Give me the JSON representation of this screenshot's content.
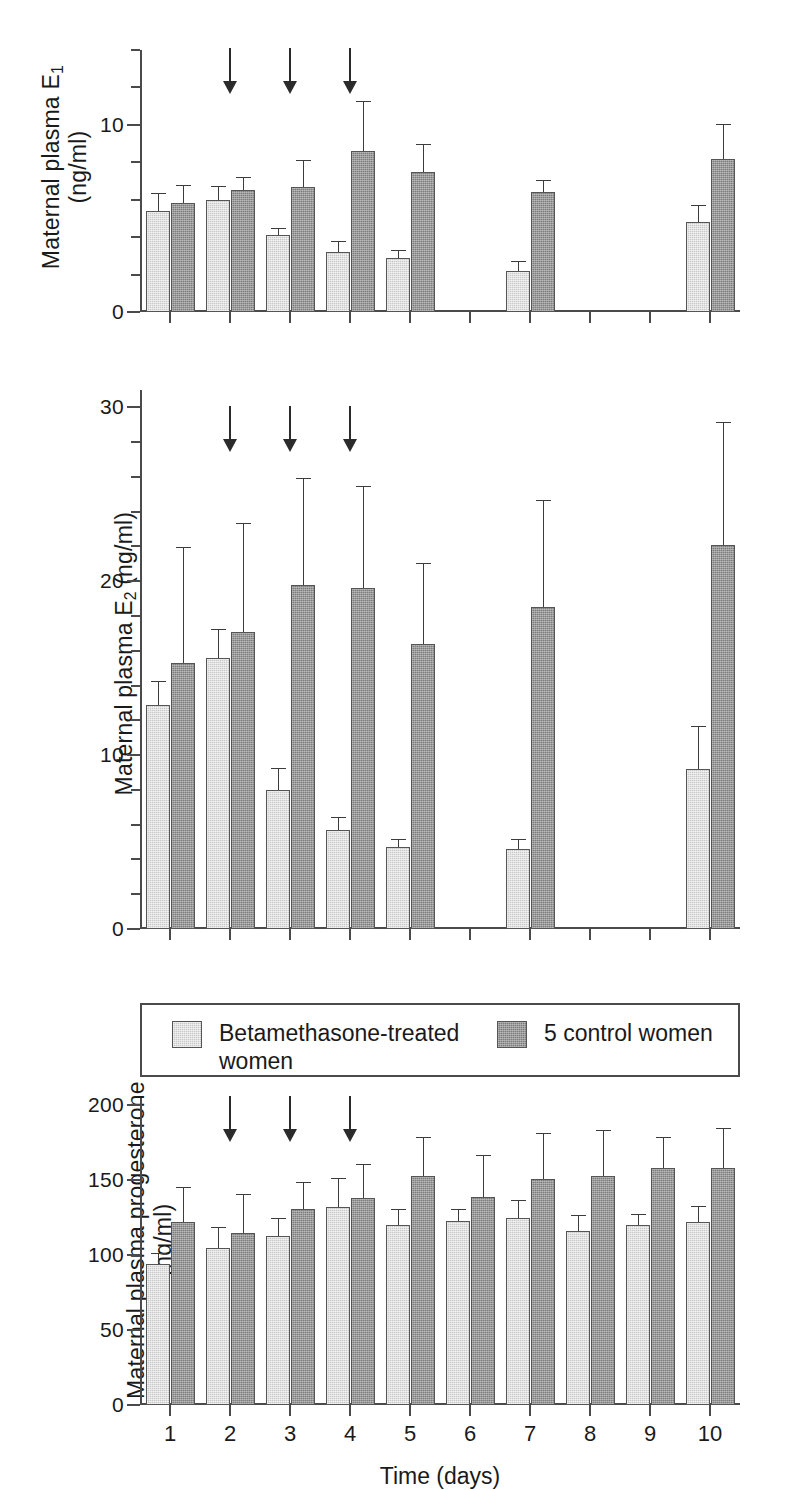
{
  "figure": {
    "xlabel": "Time (days)",
    "categories": [
      "1",
      "2",
      "3",
      "4",
      "5",
      "6",
      "7",
      "8",
      "9",
      "10"
    ],
    "treatment_arrow_days": [
      2,
      3,
      4
    ],
    "colors": {
      "treated_bar": "#c9c9c9",
      "control_bar": "#7d7d7d",
      "axis": "#4a4a4a",
      "text": "#1a1a1a",
      "error_bar": "#3c3c3c"
    }
  },
  "legend": {
    "treated_label": "Betamethasone-treated women",
    "control_label": "5 control women"
  },
  "chart_data": [
    {
      "type": "bar",
      "id": "panel-e1",
      "title": "",
      "ylabel": "Maternal plasma E₁ (ng/ml)",
      "ylabel_line1": "Maternal plasma E",
      "ylabel_sub1": "1",
      "ylabel_line2": "(ng/ml)",
      "xlabel": "",
      "ylim": [
        0,
        14
      ],
      "ytick_major": [
        0,
        10
      ],
      "ytick_major_labels": [
        "0",
        "10"
      ],
      "ytick_minor": [
        2,
        4,
        6,
        8,
        12,
        14
      ],
      "grid": false,
      "categories": [
        "1",
        "2",
        "3",
        "4",
        "5",
        "6",
        "7",
        "8",
        "9",
        "10"
      ],
      "series": [
        {
          "name": "Betamethasone-treated women",
          "color": "#c9c9c9",
          "values": [
            5.4,
            6.0,
            4.1,
            3.2,
            2.9,
            null,
            2.2,
            null,
            null,
            4.8
          ],
          "errors": [
            0.9,
            0.7,
            0.35,
            0.55,
            0.35,
            null,
            0.45,
            null,
            null,
            0.85
          ]
        },
        {
          "name": "5 control women",
          "color": "#7d7d7d",
          "values": [
            5.8,
            6.5,
            6.7,
            8.6,
            7.5,
            null,
            6.4,
            null,
            null,
            8.2
          ],
          "errors": [
            0.95,
            0.65,
            1.35,
            2.6,
            1.4,
            null,
            0.6,
            null,
            null,
            1.8
          ]
        }
      ]
    },
    {
      "type": "bar",
      "id": "panel-e2",
      "title": "",
      "ylabel": "Maternal plasma E₂ (ng/ml)",
      "ylabel_line1": "Maternal plasma E",
      "ylabel_sub1": "2",
      "ylabel_line2": " (ng/ml)",
      "xlabel": "",
      "ylim": [
        0,
        30
      ],
      "ytick_major": [
        0,
        10,
        20,
        30
      ],
      "ytick_major_labels": [
        "0",
        "10",
        "20",
        "30"
      ],
      "ytick_minor": [
        2,
        4,
        6,
        8,
        12,
        14,
        16,
        18,
        22,
        24,
        26,
        28
      ],
      "grid": false,
      "categories": [
        "1",
        "2",
        "3",
        "4",
        "5",
        "6",
        "7",
        "8",
        "9",
        "10"
      ],
      "series": [
        {
          "name": "Betamethasone-treated women",
          "color": "#c9c9c9",
          "values": [
            12.9,
            15.6,
            8.0,
            5.7,
            4.7,
            null,
            4.6,
            null,
            null,
            9.2
          ],
          "errors": [
            1.3,
            1.6,
            1.2,
            0.7,
            0.4,
            null,
            0.5,
            null,
            null,
            2.4
          ]
        },
        {
          "name": "5 control women",
          "color": "#7d7d7d",
          "values": [
            15.3,
            17.1,
            19.8,
            19.6,
            16.4,
            null,
            18.5,
            null,
            null,
            22.1
          ],
          "errors": [
            6.6,
            6.2,
            6.1,
            5.8,
            4.6,
            null,
            6.1,
            null,
            null,
            7.0
          ]
        }
      ]
    },
    {
      "type": "bar",
      "id": "panel-progesterone",
      "title": "",
      "ylabel": "Maternal plasma progesterone (ng/ml)",
      "ylabel_line1": "Maternal plasma progesterone",
      "ylabel_line2": "(ng/ml)",
      "xlabel": "Time (days)",
      "ylim": [
        0,
        200
      ],
      "ytick_major": [
        0,
        50,
        100,
        150,
        200
      ],
      "ytick_major_labels": [
        "0",
        "50",
        "100",
        "150",
        "200"
      ],
      "ytick_minor": [],
      "grid": false,
      "categories": [
        "1",
        "2",
        "3",
        "4",
        "5",
        "6",
        "7",
        "8",
        "9",
        "10"
      ],
      "series": [
        {
          "name": "Betamethasone-treated women",
          "color": "#c9c9c9",
          "values": [
            94,
            105,
            113,
            132,
            120,
            123,
            125,
            116,
            120,
            122
          ],
          "errors": [
            7,
            13,
            11,
            19,
            10,
            7,
            11,
            10,
            7,
            10
          ]
        },
        {
          "name": "5 control women",
          "color": "#7d7d7d",
          "values": [
            122,
            115,
            131,
            138,
            153,
            139,
            151,
            153,
            158,
            158
          ],
          "errors": [
            23,
            25,
            17,
            22,
            25,
            27,
            30,
            30,
            20,
            26
          ]
        }
      ]
    }
  ]
}
